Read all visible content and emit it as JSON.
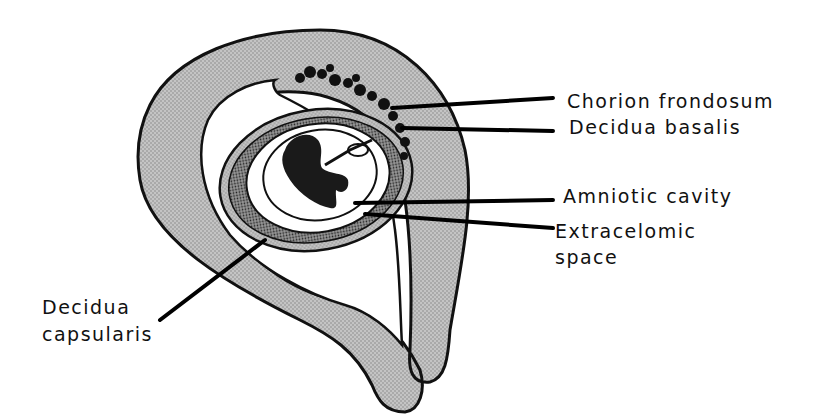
{
  "figure": {
    "colors": {
      "tissue_fill": "#bdbdbd",
      "outline": "#111111",
      "background": "#ffffff",
      "embryo": "#1a1a1a"
    }
  },
  "labels": {
    "chorion_frondosum": "Chorion frondosum",
    "decidua_basalis": "Decidua basalis",
    "amniotic_cavity": "Amniotic cavity",
    "extracelomic_line1": "Extracelomic",
    "extracelomic_line2": "space",
    "decidua_capsularis_line1": "Decidua",
    "decidua_capsularis_line2": "capsularis"
  }
}
